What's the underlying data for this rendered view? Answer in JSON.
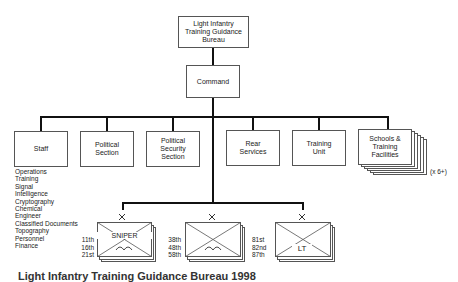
{
  "diagram": {
    "root": {
      "label": "Light Infantry\nTraining Guidance\nBureau"
    },
    "command": {
      "label": "Command"
    },
    "departments": [
      {
        "label": "Staff"
      },
      {
        "label": "Political\nSection"
      },
      {
        "label": "Political\nSecurity\nSection"
      },
      {
        "label": "Rear\nServices"
      },
      {
        "label": "Training\nUnit"
      },
      {
        "label": "Schools &\nTraining\nFacilities"
      }
    ],
    "schools_multiplier": "(x 6+)",
    "staff_functions": [
      "Operations",
      "Training",
      "Signal",
      "Intelligence",
      "Cryptography",
      "Chemical",
      "Engineer",
      "Classified Documents",
      "Topography",
      "Personnel",
      "Finance"
    ],
    "units": [
      {
        "label": "SNIPER",
        "symbol": "light-infantry-arc",
        "numbers": [
          "11th",
          "16th",
          "21st"
        ]
      },
      {
        "label": "",
        "symbol": "light-infantry-arc",
        "numbers": [
          "38th",
          "48th",
          "58th"
        ]
      },
      {
        "label": "LT",
        "symbol": "",
        "numbers": [
          "81st",
          "82nd",
          "87th"
        ]
      }
    ],
    "caption": "Light Infantry Training Guidance Bureau 1998"
  }
}
